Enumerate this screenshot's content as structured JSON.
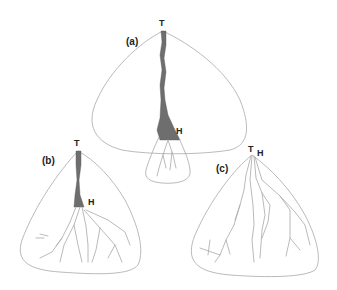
{
  "figure": {
    "panels": [
      {
        "id": "a",
        "label": "(a)",
        "apex_label": "T",
        "head_label": "H",
        "description": "Tall fan with long shaded incised trench from apex T to head H, small distal lobe beyond H"
      },
      {
        "id": "b",
        "label": "(b)",
        "apex_label": "T",
        "head_label": "H",
        "description": "Fan with medium shaded trench from T to H, distributary channels spreading below H"
      },
      {
        "id": "c",
        "label": "(c)",
        "apex_label": "T",
        "head_label": "H",
        "description": "Fan with no incised trench; T and H coincide at apex, distributary channels radiate from apex"
      }
    ],
    "colors": {
      "outline": "#a8a8a8",
      "trench_fill": "#6e6e6e",
      "label": "#222222"
    }
  }
}
